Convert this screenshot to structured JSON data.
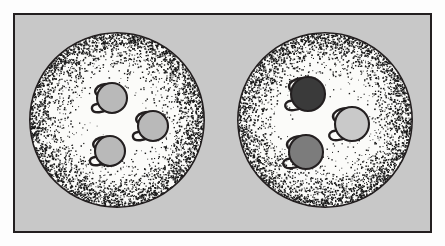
{
  "figure": {
    "title": "Two stippled cells containing circular organelles",
    "caption": "",
    "frame": {
      "border_color": "#231f20",
      "border_width_px": 2,
      "background_color": "#c8c8c8",
      "margin_color": "#fdfdfd"
    }
  },
  "palette": {
    "page_background": "#fdfdfd",
    "panel_background": "#c8c8c8",
    "outline": "#231f20",
    "cell_interior": "#fbfbf9",
    "stipple_dot": "#1a1a1a",
    "organelle_light": "#b9b9b9",
    "organelle_medium": "#7c7c7c",
    "organelle_dark": "#3a3a3a",
    "organelle_pale": "#c9c9c9"
  },
  "cells": [
    {
      "id": "cell-left",
      "label": "Left cell",
      "center_x": 117,
      "center_y": 120,
      "radius": 88,
      "stipple_seed": 17,
      "organelles": [
        {
          "id": "organelle-left-top",
          "label": "Organelle top",
          "cx": 112,
          "cy": 98,
          "r": 15,
          "fill_key": "organelle_light",
          "hook": true
        },
        {
          "id": "organelle-left-right",
          "label": "Organelle right",
          "cx": 153,
          "cy": 126,
          "r": 15,
          "fill_key": "organelle_light",
          "hook": true
        },
        {
          "id": "organelle-left-bottom",
          "label": "Organelle bottom",
          "cx": 110,
          "cy": 151,
          "r": 15,
          "fill_key": "organelle_light",
          "hook": true
        }
      ]
    },
    {
      "id": "cell-right",
      "label": "Right cell",
      "center_x": 325,
      "center_y": 120,
      "radius": 88,
      "stipple_seed": 93,
      "organelles": [
        {
          "id": "organelle-right-top",
          "label": "Dark organelle top",
          "cx": 308,
          "cy": 94,
          "r": 17,
          "fill_key": "organelle_dark",
          "hook": true
        },
        {
          "id": "organelle-right-right",
          "label": "Pale organelle right",
          "cx": 352,
          "cy": 124,
          "r": 17,
          "fill_key": "organelle_pale",
          "hook": true
        },
        {
          "id": "organelle-right-bottom",
          "label": "Medium organelle bottom",
          "cx": 306,
          "cy": 152,
          "r": 17,
          "fill_key": "organelle_medium",
          "hook": true
        }
      ]
    }
  ]
}
